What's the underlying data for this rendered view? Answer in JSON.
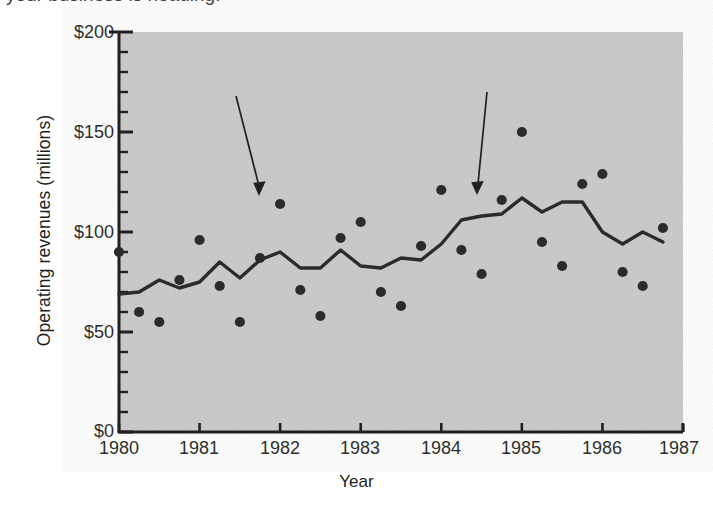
{
  "caption_fragment": "your business is heading.",
  "axes": {
    "ylabel": "Operating revenues (millions)",
    "xlabel": "Year",
    "ytick_labels": [
      "$200",
      "$150",
      "$100",
      "$50",
      "$0"
    ],
    "xtick_labels": [
      "1980",
      "1981",
      "1982",
      "1983",
      "1984",
      "1985",
      "1986",
      "1987"
    ]
  },
  "annotations": {
    "original": "Original\ndata",
    "seasonal": "Seasonally\nadjusted series"
  },
  "colors": {
    "plot_background": "#c9c9c9",
    "ink": "#231f20",
    "series_line": "#2b2b2b",
    "marker": "#2b2b2b",
    "page_background": "#ffffff"
  },
  "chart_data": {
    "type": "scatter",
    "title": "",
    "xlabel": "Year",
    "ylabel": "Operating revenues (millions)",
    "xlim": [
      1980,
      1987
    ],
    "ylim": [
      0,
      200
    ],
    "ytick_values": [
      0,
      50,
      100,
      150,
      200
    ],
    "yminor_step": 10,
    "xtick_values": [
      1980,
      1981,
      1982,
      1983,
      1984,
      1985,
      1986,
      1987
    ],
    "grid": false,
    "legend": "annotated-arrows",
    "series": [
      {
        "name": "Original data",
        "type": "scatter",
        "x": [
          1980.0,
          1980.25,
          1980.5,
          1980.75,
          1981.0,
          1981.25,
          1981.5,
          1981.75,
          1982.0,
          1982.25,
          1982.5,
          1982.75,
          1983.0,
          1983.25,
          1983.5,
          1983.75,
          1984.0,
          1984.25,
          1984.5,
          1984.75,
          1985.0,
          1985.25,
          1985.5,
          1985.75,
          1986.0,
          1986.25,
          1986.5,
          1986.75
        ],
        "y": [
          90,
          60,
          55,
          76,
          96,
          73,
          55,
          87,
          114,
          71,
          58,
          97,
          105,
          70,
          63,
          93,
          121,
          91,
          79,
          116,
          150,
          95,
          83,
          124,
          129,
          80,
          73,
          102
        ]
      },
      {
        "name": "Seasonally adjusted series",
        "type": "line",
        "x": [
          1980.0,
          1980.25,
          1980.5,
          1980.75,
          1981.0,
          1981.25,
          1981.5,
          1981.75,
          1982.0,
          1982.25,
          1982.5,
          1982.75,
          1983.0,
          1983.25,
          1983.5,
          1983.75,
          1984.0,
          1984.25,
          1984.5,
          1984.75,
          1985.0,
          1985.25,
          1985.5,
          1985.75,
          1986.0,
          1986.25,
          1986.5,
          1986.75
        ],
        "y": [
          69,
          70,
          76,
          72,
          75,
          85,
          77,
          86,
          90,
          82,
          82,
          91,
          83,
          82,
          87,
          86,
          94,
          106,
          108,
          109,
          117,
          110,
          115,
          115,
          100,
          94,
          100,
          95
        ]
      }
    ],
    "annotations": [
      {
        "text": "Original data",
        "points_to": {
          "x": 1982.0,
          "y": 114
        }
      },
      {
        "text": "Seasonally adjusted series",
        "points_to": {
          "x": 1984.6,
          "y": 108
        }
      }
    ]
  }
}
